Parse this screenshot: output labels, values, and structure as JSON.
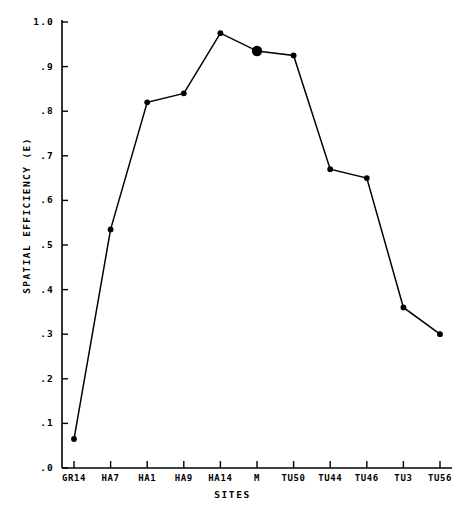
{
  "chart_data": {
    "type": "line",
    "title": "",
    "xlabel": "SITES",
    "ylabel": "SPATIAL EFFICIENCY (E)",
    "categories": [
      "GR14",
      "HA7",
      "HA1",
      "HA9",
      "HA14",
      "M",
      "TU50",
      "TU44",
      "TU46",
      "TU3",
      "TU56"
    ],
    "values": [
      0.065,
      0.535,
      0.82,
      0.84,
      0.975,
      0.935,
      0.925,
      0.67,
      0.65,
      0.36,
      0.3
    ],
    "series": [
      {
        "name": "Spatial Efficiency",
        "values": [
          0.065,
          0.535,
          0.82,
          0.84,
          0.975,
          0.935,
          0.925,
          0.67,
          0.65,
          0.36,
          0.3
        ]
      }
    ],
    "highlighted_points": [
      "M"
    ],
    "ylim": [
      0.0,
      1.0
    ],
    "ytick_labels": [
      "1.0",
      ".9",
      ".8",
      ".7",
      ".6",
      ".5",
      ".4",
      ".3",
      ".2",
      ".1",
      ".0"
    ],
    "ytick_values": [
      1.0,
      0.9,
      0.8,
      0.7,
      0.6,
      0.5,
      0.4,
      0.3,
      0.2,
      0.1,
      0.0
    ],
    "grid": false,
    "legend": null,
    "line_color": "#000000",
    "marker_color": "#000000",
    "axis_color": "#000000"
  }
}
